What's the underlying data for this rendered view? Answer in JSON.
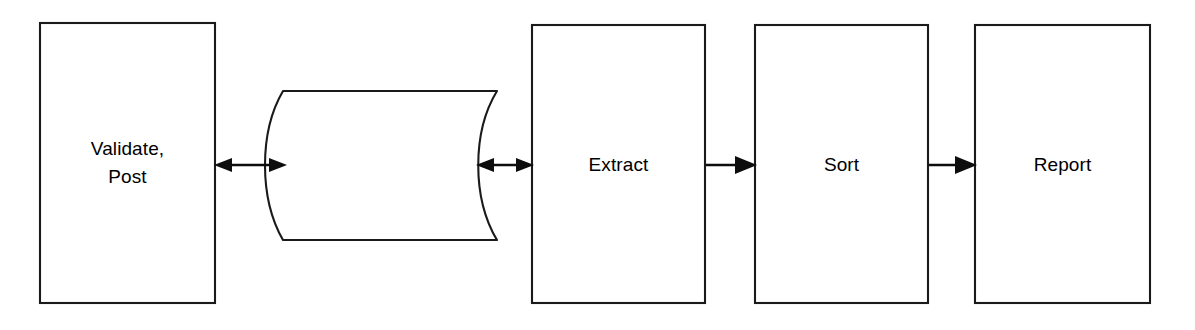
{
  "diagram": {
    "background_color": "#ffffff",
    "stroke_color": "#1a1a1a",
    "text_color": "#000000",
    "nodes": [
      {
        "id": "validate-post",
        "label": "Validate,\nPost",
        "shape": "rectangle",
        "x": 40,
        "y": 23,
        "width": 175,
        "height": 280
      },
      {
        "id": "data-store",
        "label": "",
        "shape": "cylinder-horizontal",
        "x": 268,
        "y": 91,
        "width": 232,
        "height": 149
      },
      {
        "id": "extract",
        "label": "Extract",
        "shape": "rectangle",
        "x": 532,
        "y": 25,
        "width": 173,
        "height": 278
      },
      {
        "id": "sort",
        "label": "Sort",
        "shape": "rectangle",
        "x": 755,
        "y": 25,
        "width": 173,
        "height": 278
      },
      {
        "id": "report",
        "label": "Report",
        "shape": "rectangle",
        "x": 975,
        "y": 25,
        "width": 175,
        "height": 278
      }
    ],
    "connectors": [
      {
        "id": "validate-post-to-data-store",
        "from": "validate-post",
        "to": "data-store",
        "direction": "bidirectional",
        "x1": 216,
        "x2": 284,
        "y": 165
      },
      {
        "id": "data-store-to-extract",
        "from": "data-store",
        "to": "extract",
        "direction": "bidirectional",
        "x1": 477,
        "x2": 531,
        "y": 165
      },
      {
        "id": "extract-to-sort",
        "from": "extract",
        "to": "sort",
        "direction": "forward",
        "x1": 706,
        "x2": 754,
        "y": 165
      },
      {
        "id": "sort-to-report",
        "from": "sort",
        "to": "report",
        "direction": "forward",
        "x1": 929,
        "x2": 974,
        "y": 165
      }
    ]
  }
}
